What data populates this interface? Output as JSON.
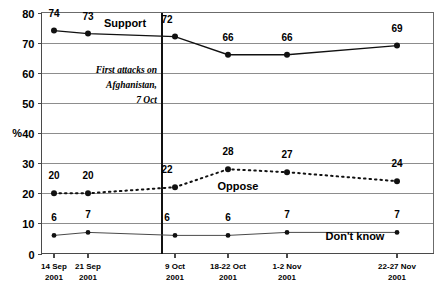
{
  "chart_data": {
    "type": "line",
    "title": "",
    "xlabel": "",
    "ylabel": "%",
    "ylim": [
      0,
      80
    ],
    "yticks": [
      0,
      10,
      20,
      30,
      40,
      50,
      60,
      70,
      80
    ],
    "grid": true,
    "legend": "inline-labels",
    "categories": [
      "14 Sep 2001",
      "21 Sep 2001",
      "9 Oct 2001",
      "18-22 Oct 2001",
      "1-2 Nov 2001",
      "22-27 Nov 2001"
    ],
    "category_lines": [
      {
        "top": "14 Sep",
        "bottom": "2001"
      },
      {
        "top": "21 Sep",
        "bottom": "2001"
      },
      {
        "top": "9 Oct",
        "bottom": "2001"
      },
      {
        "top": "18-22 Oct",
        "bottom": "2001"
      },
      {
        "top": "1-2 Nov",
        "bottom": "2001"
      },
      {
        "top": "22-27 Nov",
        "bottom": "2001"
      }
    ],
    "series": [
      {
        "name": "Support",
        "style": "solid",
        "values": [
          74,
          73,
          72,
          66,
          66,
          69
        ]
      },
      {
        "name": "Oppose",
        "style": "dotted",
        "values": [
          20,
          20,
          22,
          28,
          27,
          24
        ]
      },
      {
        "name": "Don't know",
        "style": "thin",
        "values": [
          6,
          7,
          6,
          6,
          7,
          7
        ]
      }
    ],
    "annotations": [
      {
        "name": "first-attacks",
        "lines": [
          "First attacks on",
          "Afghanistan,",
          "7 Oct"
        ],
        "at_category": "9 Oct 2001",
        "marker": "vertical-line"
      }
    ],
    "series_label_positions": {
      "Support": "top-left-center",
      "Oppose": "middle-center",
      "Don't know": "bottom-right"
    },
    "colors": {
      "ink": "#111111",
      "grid": "#8d8d8d",
      "frame": "#6b6b6b",
      "background": "#ffffff"
    }
  }
}
